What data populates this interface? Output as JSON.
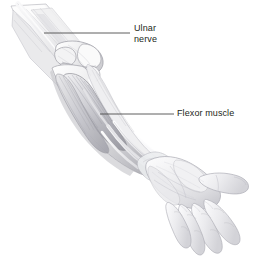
{
  "figure": {
    "background_color": "#ffffff",
    "width": 255,
    "height": 264,
    "style": "grayscale medical line-and-wash illustration"
  },
  "labels": [
    {
      "id": "ulnar-nerve",
      "line1": "Ulnar",
      "line2": "nerve",
      "text_color": "#231f20",
      "leader": {
        "x1": 44,
        "y1": 33,
        "x2": 130,
        "y2": 33,
        "color": "#4d4d4d"
      }
    },
    {
      "id": "flexor-muscle",
      "line1": "Flexor muscle",
      "line2": "",
      "text_color": "#231f20",
      "leader": {
        "x1": 100,
        "y1": 114,
        "x2": 174,
        "y2": 114,
        "color": "#4d4d4d"
      }
    }
  ],
  "palette": {
    "skin_light": "#f4f4f5",
    "skin_mid": "#e2e2e4",
    "skin_shadow": "#c9c9cd",
    "skin_deep": "#a9a9b0",
    "muscle_light": "#dcdcdf",
    "muscle_mid": "#bfbfc5",
    "muscle_dark": "#97979f",
    "bone_light": "#fafafb",
    "bone_mid": "#d7d7da",
    "outline": "#8a8a92",
    "outline_soft": "#b4b4bb",
    "leader_line": "#4d4d4d",
    "label_text": "#231f20"
  }
}
